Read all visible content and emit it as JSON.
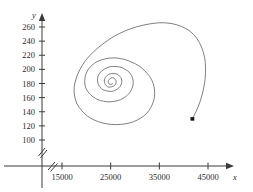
{
  "figure": {
    "background_color": "#ffffff",
    "axis_color": "#3a3a3a",
    "curve_color": "#555555",
    "marker_color": "#1a1a1a",
    "x_axis_name": "x",
    "y_axis_name": "y",
    "axis_break_symbol": "//"
  },
  "chart_data": {
    "type": "line",
    "title": "",
    "subtitle": "",
    "xlabel": "x",
    "ylabel": "y",
    "grid": false,
    "legend": null,
    "xlim": [
      10000,
      48000
    ],
    "ylim": [
      90,
      272
    ],
    "xticks": [
      15000,
      25000,
      35000,
      45000
    ],
    "yticks": [
      100,
      120,
      140,
      160,
      180,
      200,
      220,
      240,
      260
    ],
    "xtick_labels": [
      "15000",
      "25000",
      "35000",
      "45000"
    ],
    "ytick_labels": [
      "100",
      "120",
      "140",
      "160",
      "180",
      "200",
      "220",
      "240",
      "260"
    ],
    "axis_break": {
      "x_axis": true,
      "y_axis": true
    },
    "annotations": [
      {
        "name": "start-point-marker",
        "shape": "square",
        "x": 41800,
        "y": 130
      },
      {
        "name": "spiral-focus",
        "x": 25400,
        "y": 180
      }
    ],
    "series": [
      {
        "name": "trajectory",
        "description": "inward spiral converging to a stable focus",
        "marker_at_start": true,
        "points": [
          [
            41800,
            130
          ],
          [
            42600,
            141
          ],
          [
            43400,
            155
          ],
          [
            44000,
            170
          ],
          [
            44400,
            186
          ],
          [
            44500,
            202
          ],
          [
            44300,
            217
          ],
          [
            43700,
            231
          ],
          [
            42700,
            244
          ],
          [
            41300,
            254
          ],
          [
            39500,
            261
          ],
          [
            37400,
            265
          ],
          [
            35100,
            266
          ],
          [
            32700,
            264
          ],
          [
            30200,
            260
          ],
          [
            27800,
            254
          ],
          [
            25500,
            246
          ],
          [
            23400,
            236
          ],
          [
            21500,
            225
          ],
          [
            19900,
            213
          ],
          [
            18700,
            200
          ],
          [
            17900,
            187
          ],
          [
            17500,
            174
          ],
          [
            17600,
            162
          ],
          [
            18100,
            151
          ],
          [
            19000,
            142
          ],
          [
            20200,
            134
          ],
          [
            21700,
            128
          ],
          [
            23400,
            124
          ],
          [
            25200,
            122
          ],
          [
            27000,
            122
          ],
          [
            28800,
            124
          ],
          [
            30400,
            128
          ],
          [
            31800,
            134
          ],
          [
            32900,
            142
          ],
          [
            33600,
            151
          ],
          [
            34000,
            161
          ],
          [
            34000,
            171
          ],
          [
            33700,
            181
          ],
          [
            33000,
            190
          ],
          [
            32000,
            198
          ],
          [
            30800,
            205
          ],
          [
            29400,
            210
          ],
          [
            27900,
            214
          ],
          [
            26300,
            216
          ],
          [
            24800,
            216
          ],
          [
            23400,
            214
          ],
          [
            22200,
            211
          ],
          [
            21200,
            206
          ],
          [
            20400,
            200
          ],
          [
            19900,
            193
          ],
          [
            19700,
            186
          ],
          [
            19700,
            179
          ],
          [
            20000,
            172
          ],
          [
            20600,
            166
          ],
          [
            21400,
            161
          ],
          [
            22400,
            157
          ],
          [
            23500,
            155
          ],
          [
            24700,
            154
          ],
          [
            25900,
            155
          ],
          [
            27000,
            157
          ],
          [
            28000,
            161
          ],
          [
            28800,
            166
          ],
          [
            29300,
            172
          ],
          [
            29600,
            178
          ],
          [
            29600,
            185
          ],
          [
            29300,
            191
          ],
          [
            28800,
            196
          ],
          [
            28000,
            200
          ],
          [
            27100,
            203
          ],
          [
            26100,
            204
          ],
          [
            25100,
            204
          ],
          [
            24200,
            202
          ],
          [
            23400,
            199
          ],
          [
            22800,
            195
          ],
          [
            22400,
            190
          ],
          [
            22300,
            185
          ],
          [
            22400,
            180
          ],
          [
            22700,
            176
          ],
          [
            23200,
            172
          ],
          [
            23900,
            170
          ],
          [
            24600,
            169
          ],
          [
            25400,
            169
          ],
          [
            26100,
            171
          ],
          [
            26700,
            174
          ],
          [
            27100,
            178
          ],
          [
            27300,
            182
          ],
          [
            27200,
            187
          ],
          [
            26900,
            190
          ],
          [
            26400,
            193
          ],
          [
            25800,
            194
          ],
          [
            25200,
            194
          ],
          [
            24600,
            193
          ],
          [
            24100,
            190
          ],
          [
            23800,
            187
          ],
          [
            23700,
            183
          ],
          [
            23800,
            180
          ],
          [
            24100,
            177
          ],
          [
            24500,
            175
          ],
          [
            25000,
            175
          ],
          [
            25500,
            176
          ],
          [
            25900,
            178
          ],
          [
            26100,
            181
          ],
          [
            26100,
            184
          ],
          [
            25900,
            186
          ],
          [
            25600,
            188
          ],
          [
            25200,
            188
          ],
          [
            24900,
            187
          ],
          [
            24600,
            185
          ],
          [
            24500,
            183
          ],
          [
            24600,
            180
          ],
          [
            24900,
            179
          ],
          [
            25200,
            179
          ],
          [
            25400,
            180
          ]
        ]
      }
    ]
  }
}
